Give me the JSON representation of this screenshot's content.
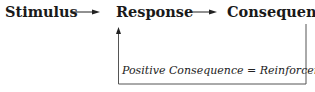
{
  "diagram": {
    "nodes": [
      {
        "id": "stimulus",
        "label": "Stimulus"
      },
      {
        "id": "response",
        "label": "Response"
      },
      {
        "id": "consequences",
        "label": "Consequences"
      }
    ],
    "edges": [
      {
        "from": "stimulus",
        "to": "response"
      },
      {
        "from": "response",
        "to": "consequences"
      },
      {
        "from": "consequences",
        "to": "response",
        "label": "Positive Consequence = Reinforcement"
      }
    ],
    "feedback_label": "Positive Consequence = Reinforcement"
  }
}
